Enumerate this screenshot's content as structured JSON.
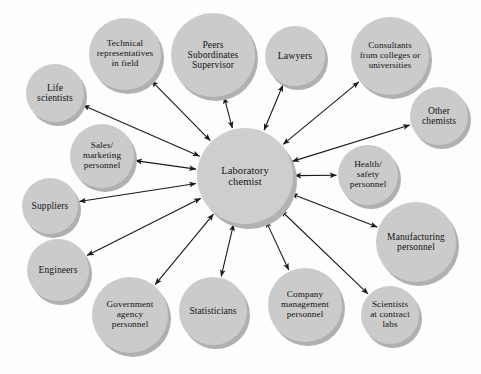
{
  "diagram": {
    "type": "hub-and-spoke network diagram",
    "title": "",
    "edge_style": "double-headed arrow",
    "colors": {
      "background": "#fdfdfc",
      "node_fill": "#cbcbcb",
      "node_shadow": "#b0b0b0",
      "edge": "#1a1a1a",
      "text": "#141414"
    },
    "center": {
      "id": "laboratory-chemist",
      "label": "Laboratory\nchemist",
      "cx": 245,
      "cy": 176,
      "r": 48,
      "font_size": 10.5
    },
    "nodes": [
      {
        "id": "life-scientists",
        "label": "Life\nscientists",
        "cx": 55,
        "cy": 93,
        "r": 29,
        "font_size": 9.5
      },
      {
        "id": "technical-representatives",
        "label": "Technical\nrepresentatives\nin field",
        "cx": 125,
        "cy": 54,
        "r": 36,
        "font_size": 9.2
      },
      {
        "id": "peers-subordinates",
        "label": "Peers\nSubordinates\nSupervisor",
        "cx": 213,
        "cy": 55,
        "r": 42,
        "font_size": 9.5
      },
      {
        "id": "lawyers",
        "label": "Lawyers",
        "cx": 295,
        "cy": 56,
        "r": 30,
        "font_size": 9.8
      },
      {
        "id": "consultants-colleges",
        "label": "Consultants\nfrom colleges or\nuniversities",
        "cx": 390,
        "cy": 56,
        "r": 39,
        "font_size": 9.0
      },
      {
        "id": "other-chemists",
        "label": "Other\nchemists",
        "cx": 439,
        "cy": 116,
        "r": 29,
        "font_size": 9.5
      },
      {
        "id": "health-safety-personnel",
        "label": "Health/\nsafety\npersonnel",
        "cx": 368,
        "cy": 175,
        "r": 30,
        "font_size": 9.2
      },
      {
        "id": "manufacturing-personnel",
        "label": "Manufacturing\npersonnel",
        "cx": 416,
        "cy": 242,
        "r": 40,
        "font_size": 9.5
      },
      {
        "id": "scientists-contract-labs",
        "label": "Scientists\nat contract\nlabs",
        "cx": 390,
        "cy": 315,
        "r": 29,
        "font_size": 9.2
      },
      {
        "id": "company-management",
        "label": "Company\nmanagement\npersonnel",
        "cx": 305,
        "cy": 305,
        "r": 37,
        "font_size": 9.2
      },
      {
        "id": "statisticians",
        "label": "Statisticians",
        "cx": 213,
        "cy": 311,
        "r": 34,
        "font_size": 9.5
      },
      {
        "id": "government-agency",
        "label": "Government\nagency\npersonnel",
        "cx": 130,
        "cy": 315,
        "r": 38,
        "font_size": 9.2
      },
      {
        "id": "engineers",
        "label": "Engineers",
        "cx": 58,
        "cy": 270,
        "r": 31,
        "font_size": 9.5
      },
      {
        "id": "suppliers",
        "label": "Suppliers",
        "cx": 50,
        "cy": 206,
        "r": 28,
        "font_size": 9.5
      },
      {
        "id": "sales-marketing",
        "label": "Sales/\nmarketing\npersonnel",
        "cx": 102,
        "cy": 156,
        "r": 32,
        "font_size": 9.2
      }
    ],
    "edges": [
      {
        "from": "laboratory-chemist",
        "to": "life-scientists",
        "bidirectional": true
      },
      {
        "from": "laboratory-chemist",
        "to": "technical-representatives",
        "bidirectional": true
      },
      {
        "from": "laboratory-chemist",
        "to": "peers-subordinates",
        "bidirectional": true
      },
      {
        "from": "laboratory-chemist",
        "to": "lawyers",
        "bidirectional": true
      },
      {
        "from": "laboratory-chemist",
        "to": "consultants-colleges",
        "bidirectional": true
      },
      {
        "from": "laboratory-chemist",
        "to": "other-chemists",
        "bidirectional": true
      },
      {
        "from": "laboratory-chemist",
        "to": "health-safety-personnel",
        "bidirectional": true
      },
      {
        "from": "laboratory-chemist",
        "to": "manufacturing-personnel",
        "bidirectional": true
      },
      {
        "from": "laboratory-chemist",
        "to": "scientists-contract-labs",
        "bidirectional": true
      },
      {
        "from": "laboratory-chemist",
        "to": "company-management",
        "bidirectional": true
      },
      {
        "from": "laboratory-chemist",
        "to": "statisticians",
        "bidirectional": true
      },
      {
        "from": "laboratory-chemist",
        "to": "government-agency",
        "bidirectional": true
      },
      {
        "from": "laboratory-chemist",
        "to": "engineers",
        "bidirectional": true
      },
      {
        "from": "laboratory-chemist",
        "to": "suppliers",
        "bidirectional": true
      },
      {
        "from": "laboratory-chemist",
        "to": "sales-marketing",
        "bidirectional": true
      }
    ]
  }
}
